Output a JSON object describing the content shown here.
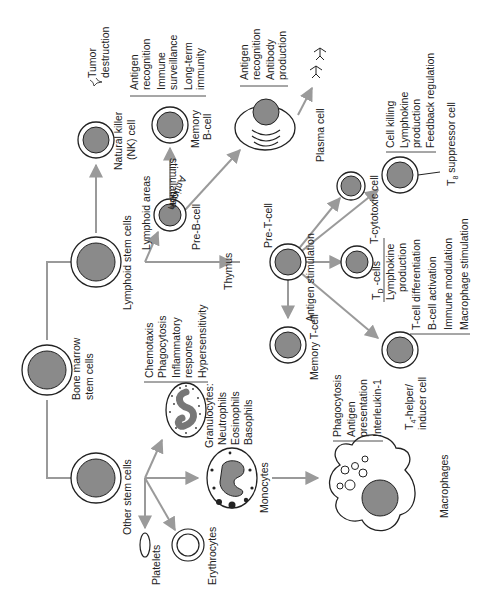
{
  "diagram": {
    "colors": {
      "nucleus": "#8a8a8a",
      "arrow": "#9a9a9a",
      "line": "#222222",
      "background": "#ffffff"
    },
    "nodes": {
      "bone_marrow": "Bone marrow stem cells",
      "bone_marrow_l1": "Bone marrow",
      "bone_marrow_l2": "stem cells",
      "lymphoid_stem": "Lymphoid stem cells",
      "other_stem": "Other stem cells",
      "nk_cell_l1": "Natural killer",
      "nk_cell_l2": "(NK) cell",
      "lymphoid_areas": "Lymphoid areas",
      "pre_b": "Pre-B-cell",
      "memory_b_l1": "Memory",
      "memory_b_l2": "B-cell",
      "antigen_stim_b_l1": "Antigen",
      "antigen_stim_b_l2": "stimulation",
      "plasma": "Plasma cell",
      "thymus": "Thymus",
      "pre_t": "Pre-T-cell",
      "antigen_stim_t": "Antigen stimulation",
      "memory_t": "Memory T-cell",
      "t_cytotoxic": "T-cytotoxic cell",
      "td_cells": "T",
      "td_sub": "D",
      "td_suffix": " -cells",
      "t8": "T",
      "t8_sub": "8",
      "t8_suffix": " suppressor cell",
      "t4_l1_pre": "T",
      "t4_sub": "4",
      "t4_l1_suffix": "-helper/",
      "t4_l2": "inducer cell",
      "granulocytes": "Granulocytes:",
      "neutrophils": "Neutrophils",
      "eosinophils": "Eosinophils",
      "basophils": "Basophils",
      "monocytes": "Monocytes",
      "macrophages": "Macrophages",
      "platelets": "Platelets",
      "erythrocytes": "Erythrocytes"
    },
    "functions": {
      "nk": [
        "Tumor",
        "destruction"
      ],
      "memory_b": [
        "Antigen",
        "recognition",
        "Immune",
        "surveillance",
        "Long-term",
        "immunity"
      ],
      "plasma": [
        "Antigen",
        "recognition",
        "Antibody",
        "production"
      ],
      "cytotoxic": [
        "Cell killing",
        "Lymphokine",
        "production",
        "Feedback regulation"
      ],
      "td": [
        "Lymphokine",
        "production"
      ],
      "t4": [
        "T-cell differentiation",
        "B-cell activation",
        "Immune modulation",
        "Macrophage stimulation"
      ],
      "granulocyte": [
        "Chemotaxis",
        "Phagocytosis",
        "Inflammatory",
        "response",
        "Hypersensitivity"
      ],
      "macrophage": [
        "Phagocytosis",
        "Antigen",
        "presentation",
        "Interleukin-1"
      ]
    }
  }
}
